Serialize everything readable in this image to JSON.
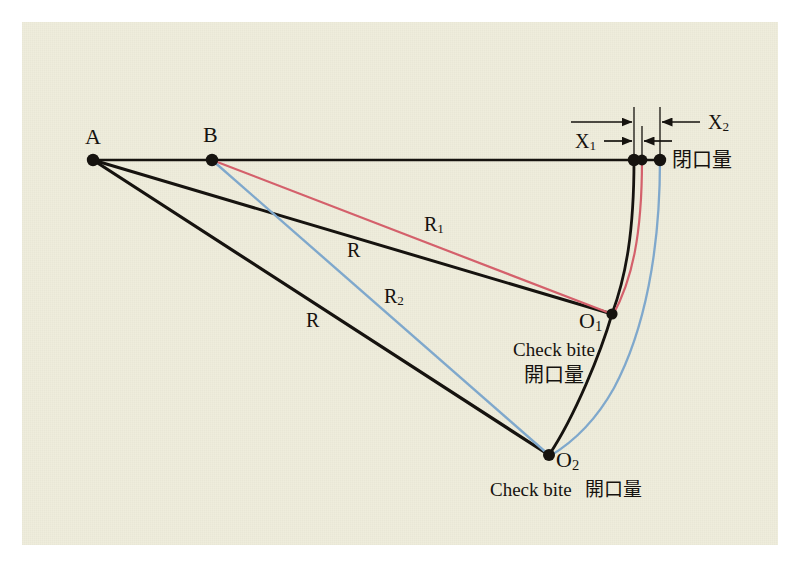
{
  "figure": {
    "background_color": "#efeddc",
    "page_color": "#ffffff",
    "ink_color": "#16130f",
    "colors": {
      "black": "#16130f",
      "red": "#d4606b",
      "blue": "#7fa8cc"
    }
  },
  "points": [
    {
      "id": "A",
      "label": "A",
      "x": 93,
      "y": 160
    },
    {
      "id": "B",
      "label": "B",
      "x": 212,
      "y": 160
    },
    {
      "id": "O1",
      "label": "O",
      "sub": "1",
      "x": 612,
      "y": 314
    },
    {
      "id": "O2",
      "label": "O",
      "sub": "2",
      "x": 549,
      "y": 455
    },
    {
      "id": "Pk",
      "label": "",
      "x": 634,
      "y": 160
    },
    {
      "id": "Pr",
      "label": "",
      "x": 642,
      "y": 160
    },
    {
      "id": "Pb",
      "label": "",
      "x": 660,
      "y": 160
    }
  ],
  "radius_labels": [
    {
      "name": "R1",
      "base": "R",
      "sub": "1",
      "color": "#d4606b",
      "x": 432,
      "y": 228,
      "meaning": "radius of red arc (B to O1)"
    },
    {
      "name": "R",
      "base": "R",
      "sub": "",
      "color": "#16130f",
      "x": 353,
      "y": 253,
      "meaning": "radius of upper black arc (A to O1)"
    },
    {
      "name": "R2",
      "base": "R",
      "sub": "2",
      "color": "#7fa8cc",
      "x": 393,
      "y": 299,
      "meaning": "radius of blue arc (B to O2)"
    },
    {
      "name": "R",
      "base": "R",
      "sub": "",
      "color": "#16130f",
      "x": 312,
      "y": 322,
      "meaning": "radius of lower black arc (A to O2)"
    }
  ],
  "dimension_labels": [
    {
      "name": "X1",
      "base": "X",
      "sub": "1",
      "x": 583,
      "y": 145,
      "span_from": 634,
      "span_to": 642
    },
    {
      "name": "X2",
      "base": "X",
      "sub": "2",
      "x": 716,
      "y": 128,
      "span_from": 634,
      "span_to": 660
    }
  ],
  "annotations": {
    "closing_amount": "閉口量",
    "check_bite_line1": "Check bite",
    "check_bite_line2": "開口量",
    "caption_latin": "Check bite",
    "caption_cjk": "開口量"
  }
}
